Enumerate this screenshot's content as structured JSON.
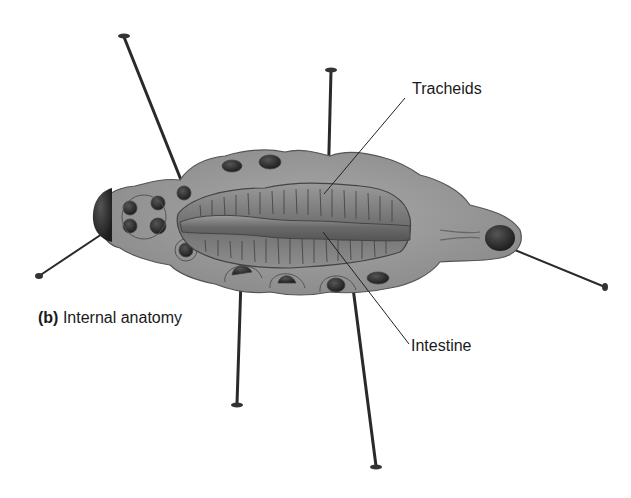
{
  "figure": {
    "caption_letter": "(b)",
    "caption_text": "Internal anatomy",
    "labels": {
      "tracheids": "Tracheids",
      "intestine": "Intestine"
    }
  }
}
